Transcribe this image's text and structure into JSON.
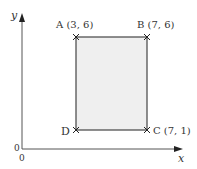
{
  "diagram": {
    "type": "coordinate-rectangle",
    "axes": {
      "x_label": "x",
      "y_label": "y",
      "origin_x_label": "0",
      "origin_y_label": "0"
    },
    "points": [
      {
        "name": "A",
        "label": "A (3, 6)",
        "x": 3,
        "y": 6
      },
      {
        "name": "B",
        "label": "B (7, 6)",
        "x": 7,
        "y": 6
      },
      {
        "name": "C",
        "label": "C (7, 1)",
        "x": 7,
        "y": 1
      },
      {
        "name": "D",
        "label": "D",
        "x": 3,
        "y": 1
      }
    ],
    "colors": {
      "fill": "#efefef",
      "stroke": "#444444",
      "axis": "#555555"
    }
  }
}
